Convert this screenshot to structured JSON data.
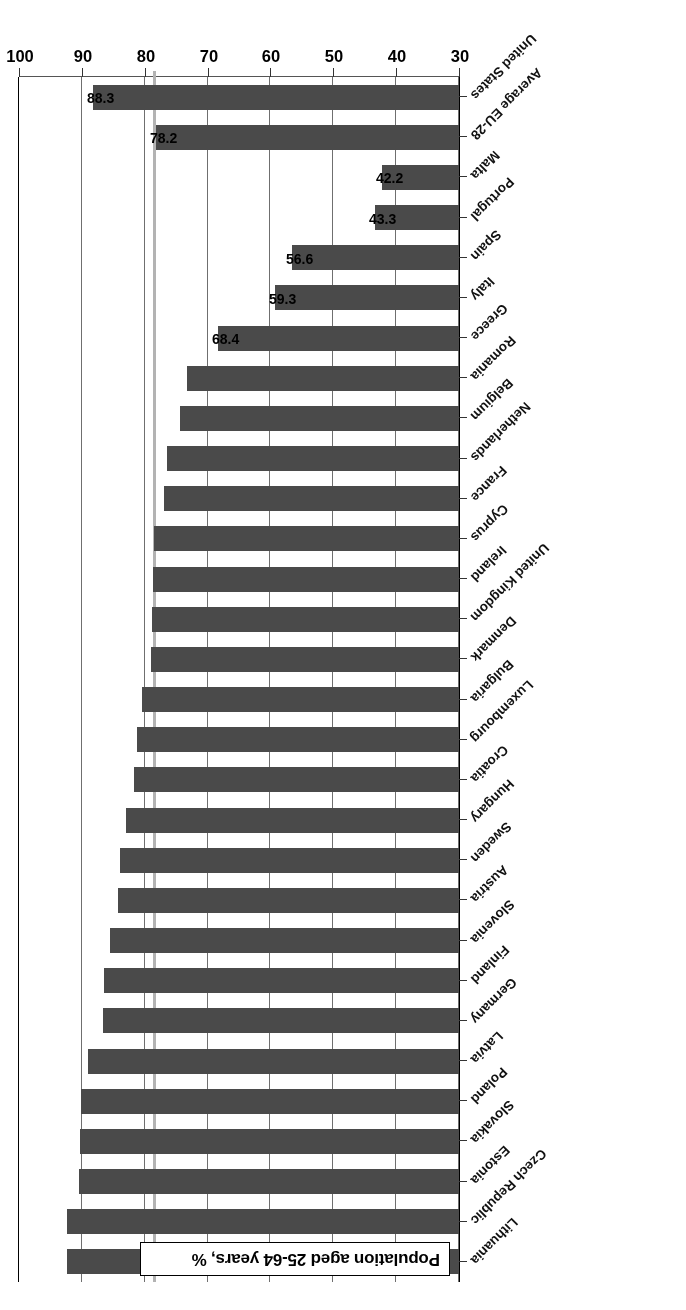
{
  "title": "Population aged 25-64 years, %",
  "chart_data": {
    "type": "bar",
    "orientation": "horizontal",
    "title": "Population aged 25-64 years, %",
    "xlabel": "",
    "ylabel": "",
    "xlim": [
      30,
      100
    ],
    "xticks": [
      30,
      40,
      50,
      60,
      70,
      80,
      90,
      100
    ],
    "grid": true,
    "legend": "none",
    "bar_color": "#4a4a4a",
    "reference_line": {
      "label": "Average EU-28",
      "value": 78.2,
      "color": "#b3b3b3"
    },
    "value_label_decimals": 1,
    "categories": [
      "Lithuania",
      "Czech Republic",
      "Estonia",
      "Slovakia",
      "Poland",
      "Latvia",
      "Germany",
      "Finland",
      "Slovenia",
      "Austria",
      "Sweden",
      "Hungary",
      "Croatia",
      "Luxembourg",
      "Bulgaria",
      "Denmark",
      "United Kingdom",
      "Ireland",
      "Cyprus",
      "France",
      "Netherlands",
      "Belgium",
      "Romania",
      "Greece",
      "Italy",
      "Spain",
      "Portugal",
      "Malta",
      "Average EU-28",
      "United States"
    ],
    "values": [
      92.4,
      92.3,
      90.4,
      90.3,
      90.1,
      89.1,
      86.6,
      86.4,
      85.6,
      84.2,
      83.9,
      82.9,
      81.7,
      81.2,
      80.4,
      79.0,
      78.8,
      78.7,
      78.5,
      77.0,
      76.4,
      74.4,
      73.3,
      68.4,
      59.3,
      56.6,
      43.3,
      42.2,
      78.2,
      88.3
    ],
    "labeled_points": [
      {
        "category": "Greece",
        "value": 68.4,
        "label": "68.4"
      },
      {
        "category": "Italy",
        "value": 59.3,
        "label": "59.3"
      },
      {
        "category": "Spain",
        "value": 56.6,
        "label": "56.6"
      },
      {
        "category": "Portugal",
        "value": 43.3,
        "label": "43.3"
      },
      {
        "category": "Malta",
        "value": 42.2,
        "label": "42.2"
      },
      {
        "category": "Average EU-28",
        "value": 78.2,
        "label": "78.2"
      },
      {
        "category": "United States",
        "value": 88.3,
        "label": "88.3"
      }
    ]
  }
}
